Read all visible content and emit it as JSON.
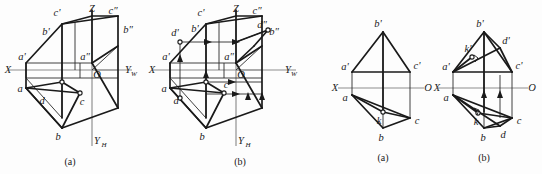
{
  "figure": {
    "background": "#fdfdfd",
    "ink": "#1a1a1a",
    "axis_color": "#8d8d8d"
  },
  "panels": [
    {
      "id": "panel-1",
      "caption": "(a)",
      "type": "axonometric-projection-box",
      "axes": [
        {
          "name": "X",
          "label": "X"
        },
        {
          "name": "Z",
          "label": "Z"
        },
        {
          "name": "YH",
          "label": "Y",
          "subscript": "H"
        },
        {
          "name": "origin",
          "label": "O"
        }
      ],
      "points": [
        {
          "label": "a",
          "prime": "a'",
          "double": "a″"
        },
        {
          "label": "b",
          "prime": "b'",
          "double": "b″"
        },
        {
          "label": "c",
          "prime": "c'",
          "double": "c″"
        },
        {
          "label": "d",
          "prime": "d'",
          "double": "d″"
        }
      ],
      "visible_labels": [
        "c'",
        "Z",
        "c″",
        "b'",
        "b″",
        "a'",
        "a″",
        "X",
        "O",
        "Y",
        "H",
        "a",
        "d",
        "c",
        "b"
      ]
    },
    {
      "id": "panel-2",
      "caption": "(b)",
      "type": "axonometric-projection-box",
      "axes": [
        {
          "name": "X",
          "label": "X"
        },
        {
          "name": "Z",
          "label": "Z"
        },
        {
          "name": "YH",
          "label": "Y",
          "subscript": "H"
        },
        {
          "name": "YW",
          "label": "Y",
          "subscript": "W"
        },
        {
          "name": "origin",
          "label": "O"
        }
      ],
      "points": [
        {
          "label": "a",
          "prime": "a'",
          "double": "a″"
        },
        {
          "label": "b",
          "prime": "b'",
          "double": "b″"
        },
        {
          "label": "c",
          "prime": "c'",
          "double": "c″"
        },
        {
          "label": "d",
          "prime": "d'",
          "double": "d″"
        }
      ],
      "visible_labels": [
        "c'",
        "Z",
        "c″",
        "d'",
        "b'",
        "b″",
        "a'",
        "d″",
        "a″",
        "X",
        "O",
        "Y",
        "W",
        "a",
        "d",
        "c",
        "b",
        "Y",
        "H"
      ],
      "annotations": "projection direction arrows"
    },
    {
      "id": "panel-3",
      "caption": "(a)",
      "type": "orthographic-two-view",
      "axes": [
        {
          "name": "X",
          "label": "X"
        },
        {
          "name": "origin",
          "label": "O"
        }
      ],
      "points": [
        {
          "label": "a",
          "prime": "a'"
        },
        {
          "label": "b",
          "prime": "b'"
        },
        {
          "label": "c",
          "prime": "c'"
        },
        {
          "label": "k",
          "prime": ""
        }
      ],
      "visible_labels": [
        "b'",
        "a'",
        "c'",
        "X",
        "O",
        "a",
        "k",
        "c",
        "b"
      ]
    },
    {
      "id": "panel-4",
      "caption": "(b)",
      "type": "orthographic-two-view",
      "axes": [
        {
          "name": "X",
          "label": "X"
        },
        {
          "name": "origin",
          "label": "O"
        }
      ],
      "points": [
        {
          "label": "a",
          "prime": "a'"
        },
        {
          "label": "b",
          "prime": "b'"
        },
        {
          "label": "c",
          "prime": "c'"
        },
        {
          "label": "d",
          "prime": "d'"
        },
        {
          "label": "k",
          "prime": "k'"
        }
      ],
      "visible_labels": [
        "b'",
        "d'",
        "k'",
        "a'",
        "c'",
        "X",
        "O",
        "a",
        "k",
        "b",
        "d",
        "c"
      ],
      "annotations": "projection direction arrows, right-angle markers"
    }
  ],
  "labels": {
    "X": "X",
    "Z": "Z",
    "Y": "Y",
    "O": "O",
    "subH": "H",
    "subW": "W",
    "a": "a",
    "b": "b",
    "c": "c",
    "d": "d",
    "k": "k",
    "ap": "a'",
    "bp": "b'",
    "cp": "c'",
    "dp": "d'",
    "kp": "k'",
    "add": "a″",
    "bdd": "b″",
    "cdd": "c″",
    "ddd": "d″",
    "capA": "(a)",
    "capB": "(b)"
  }
}
